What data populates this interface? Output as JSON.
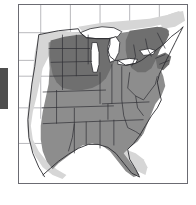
{
  "figure": {
    "kind": "distribution-range-map",
    "region": "Eastern and Central United States",
    "title": "",
    "caption": "",
    "background_color": "#ffffff",
    "frame_color": "#6b6b72"
  },
  "legend": {
    "visible": false,
    "classes": [
      {
        "id": "core",
        "label": "",
        "color": "#6f6f6f",
        "rank": 3
      },
      {
        "id": "main",
        "label": "",
        "color": "#8d8d8d",
        "rank": 2
      },
      {
        "id": "peripheral",
        "label": "",
        "color": "#d6d6d6",
        "rank": 1
      },
      {
        "id": "absent",
        "label": "",
        "color": "#ffffff",
        "rank": 0
      }
    ]
  },
  "map": {
    "graticule_color": "#9a9aa0",
    "state_border_color": "#2f2f34",
    "coastline_color": "#2a2a2e",
    "lake_fill": "#ffffff",
    "lake_outline": "#2a2a2e",
    "lakes": [
      "Lake Superior",
      "Lake Michigan",
      "Lake Huron",
      "Lake Erie",
      "Lake Ontario"
    ],
    "shaded_areas": [
      {
        "class": "core",
        "name": "northern-plains-upper-midwest-core",
        "approx_states": [
          "North Dakota",
          "South Dakota",
          "Minnesota",
          "Iowa",
          "Nebraska",
          "Wisconsin"
        ]
      },
      {
        "class": "core",
        "name": "northeast-core",
        "approx_states": [
          "New York",
          "Pennsylvania",
          "Vermont",
          "New Hampshire",
          "Massachusetts",
          "Connecticut",
          "New Jersey",
          "Ohio"
        ]
      },
      {
        "class": "main",
        "name": "central-eastern-main-range",
        "approx_states": [
          "Texas",
          "Oklahoma",
          "Kansas",
          "Missouri",
          "Arkansas",
          "Louisiana",
          "Mississippi",
          "Alabama",
          "Georgia",
          "Tennessee",
          "Kentucky",
          "Illinois",
          "Indiana",
          "Michigan",
          "West Virginia",
          "Virginia",
          "North Carolina",
          "South Carolina",
          "Maryland",
          "Delaware",
          "Florida"
        ]
      },
      {
        "class": "peripheral",
        "name": "western-margin-halo",
        "approx_states": [
          "Montana",
          "Wyoming",
          "Colorado",
          "New Mexico",
          "western Texas"
        ]
      },
      {
        "class": "peripheral",
        "name": "southern-florida-margin",
        "approx_states": [
          "southern Florida"
        ]
      },
      {
        "class": "peripheral",
        "name": "northern-border-margin",
        "approx_states": [
          "northern Minnesota",
          "northern Michigan",
          "Maine"
        ]
      }
    ]
  },
  "artifacts": {
    "left_edge_bar": {
      "name": "cropped-scan-bar",
      "color": "#4e4e4e"
    }
  }
}
